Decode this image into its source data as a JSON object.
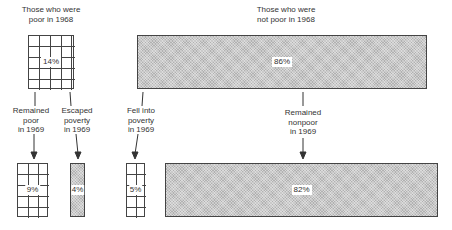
{
  "diagram": {
    "title": "",
    "top_labels": {
      "poor_1968": [
        "Those who were",
        "poor in 1968"
      ],
      "not_poor_1968": [
        "Those who were",
        "not poor in 1968"
      ]
    },
    "middle_labels": {
      "remained_poor": [
        "Remained",
        "poor",
        "in 1969"
      ],
      "escaped_poverty": [
        "Escaped",
        "poverty",
        "in 1969"
      ],
      "fell_into_poverty": [
        "Fell into",
        "poverty",
        "in 1969"
      ],
      "remained_nonpoor": [
        "Remained",
        "nonpoor",
        "in 1969"
      ]
    },
    "boxes": {
      "poor_1968": {
        "value": "14%",
        "pattern": "grid"
      },
      "not_poor_1968": {
        "value": "86%",
        "pattern": "stipple"
      },
      "remained_poor": {
        "value": "9%",
        "pattern": "grid"
      },
      "escaped_poverty": {
        "value": "4%",
        "pattern": "stipple"
      },
      "fell_into_poverty": {
        "value": "5%",
        "pattern": "grid"
      },
      "remained_nonpoor": {
        "value": "82%",
        "pattern": "stipple"
      }
    }
  }
}
